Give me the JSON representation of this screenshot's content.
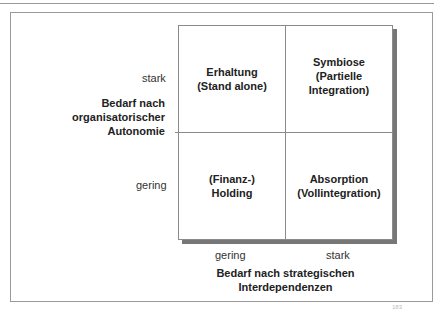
{
  "matrix": {
    "cells": {
      "top_left": "Erhaltung\n(Stand alone)",
      "top_right": "Symbiose\n(Partielle\nIntegration)",
      "bottom_left": "(Finanz-)\nHolding",
      "bottom_right": "Absorption\n(Vollintegration)"
    }
  },
  "y_axis": {
    "title": "Bedarf nach\norganisatorischer\nAutonomie",
    "high_label": "stark",
    "low_label": "gering"
  },
  "x_axis": {
    "title": "Bedarf nach strategischen\nInterdependenzen",
    "low_label": "gering",
    "high_label": "stark"
  },
  "footnote": "183"
}
